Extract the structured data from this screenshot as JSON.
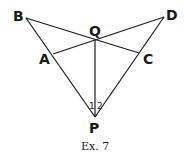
{
  "figure": {
    "caption": "Ex. 7",
    "points": {
      "B": {
        "label": "B",
        "x": 26,
        "y": 18
      },
      "D": {
        "label": "D",
        "x": 164,
        "y": 17
      },
      "Q": {
        "label": "Q",
        "x": 95,
        "y": 40
      },
      "A": {
        "label": "A",
        "x": 53,
        "y": 54
      },
      "C": {
        "label": "C",
        "x": 139,
        "y": 53
      },
      "P": {
        "label": "P",
        "x": 95,
        "y": 117
      }
    },
    "segments": [
      [
        "B",
        "P"
      ],
      [
        "D",
        "P"
      ],
      [
        "B",
        "C"
      ],
      [
        "A",
        "D"
      ],
      [
        "Q",
        "P"
      ]
    ],
    "angles": [
      {
        "label": "1",
        "at": "P",
        "between": [
          "P",
          "B",
          "Q"
        ]
      },
      {
        "label": "2",
        "at": "P",
        "between": [
          "P",
          "Q",
          "D"
        ]
      }
    ],
    "color": "#1a1a1a"
  }
}
